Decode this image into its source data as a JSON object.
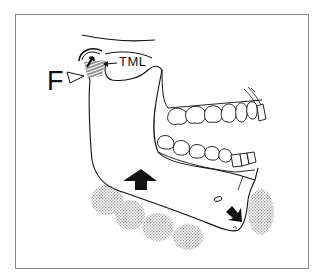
{
  "figure": {
    "type": "anatomical line drawing",
    "labels": {
      "F": "F",
      "TML": "TML"
    },
    "annotations": [
      {
        "id": "F",
        "kind": "open triangle pointer",
        "target": "condyle / posterior ramus"
      },
      {
        "id": "TML",
        "kind": "leader arrow",
        "target": "hatched region at condyle"
      },
      {
        "id": "upward-arrow",
        "kind": "solid block arrow",
        "direction": "up",
        "location": "mandibular body"
      },
      {
        "id": "down-right-arrow",
        "kind": "solid arrow",
        "direction": "down-right",
        "location": "anterior mandible"
      },
      {
        "id": "condyle-arrow",
        "kind": "small solid arrow",
        "direction": "up-right",
        "location": "inside condyle"
      }
    ],
    "colors": {
      "line": "#111111",
      "frame": "#8a8a8a",
      "stipple": "#b8b8b8",
      "background": "#ffffff"
    }
  }
}
